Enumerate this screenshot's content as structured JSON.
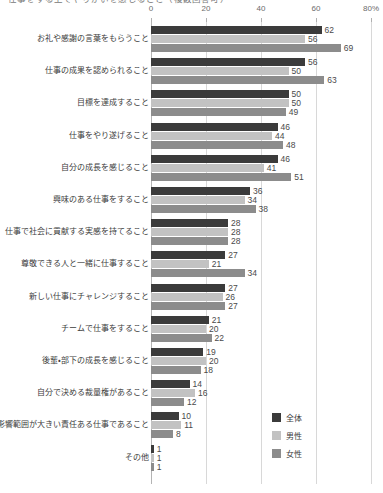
{
  "chart_data": {
    "type": "bar",
    "orientation": "horizontal",
    "title": "仕事をする上でやりがいを感じること（複数回答可）",
    "xlabel": "",
    "ylabel": "",
    "xlim": [
      0,
      80
    ],
    "grid": true,
    "legend_position": "bottom-right",
    "tick_labels": [
      "0",
      "20",
      "40",
      "60",
      "80%"
    ],
    "ticks": [
      0,
      20,
      40,
      60,
      80
    ],
    "categories": [
      "お礼や感謝の言葉をもらうこと",
      "仕事の成果を認められること",
      "目標を達成すること",
      "仕事をやり遂げること",
      "自分の成長を感じること",
      "興味のある仕事をすること",
      "仕事で社会に貢献する実感を持てること",
      "尊敬できる人と一緒に仕事すること",
      "新しい仕事にチャレンジすること",
      "チームで仕事をすること",
      "後輩・部下の成長を感じること",
      "自分で決める裁量権があること",
      "影響範囲が大きい責任ある仕事であること",
      "その他"
    ],
    "series": [
      {
        "name": "全体",
        "color": "#3b3b3b",
        "values": [
          62,
          56,
          50,
          46,
          46,
          36,
          28,
          27,
          27,
          21,
          19,
          14,
          10,
          1
        ]
      },
      {
        "name": "男性",
        "color": "#c2c2c2",
        "values": [
          56,
          50,
          50,
          44,
          41,
          34,
          28,
          21,
          26,
          20,
          20,
          16,
          11,
          1
        ]
      },
      {
        "name": "女性",
        "color": "#8c8c8c",
        "values": [
          69,
          63,
          49,
          48,
          51,
          38,
          28,
          34,
          27,
          22,
          18,
          12,
          8,
          1
        ]
      }
    ]
  }
}
